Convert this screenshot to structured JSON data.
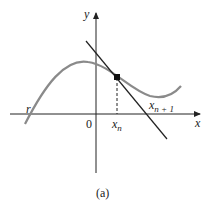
{
  "diagram": {
    "labels": {
      "y_axis": "y",
      "x_axis": "x",
      "origin": "0",
      "root": "r",
      "xn_base": "x",
      "xn_sub": "n",
      "xn1_base": "x",
      "xn1_sub": "n + 1",
      "caption": "(a)"
    },
    "colors": {
      "curve": "#8a8a8a",
      "axes": "#222222",
      "tangent": "#222222"
    }
  }
}
